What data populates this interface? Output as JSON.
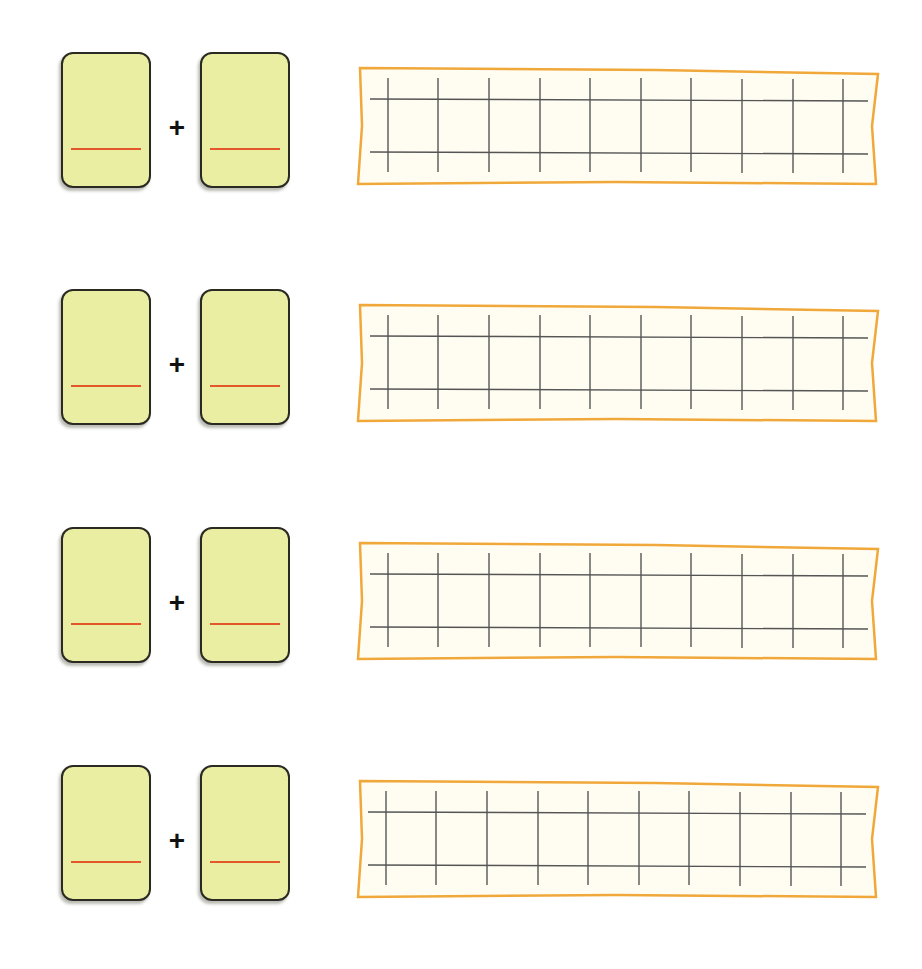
{
  "worksheet": {
    "operator_symbol": "+",
    "colors": {
      "card_fill": "#e9eea2",
      "card_border": "#2a2a22",
      "answer_line": "#e3572b",
      "grid_border": "#f0a83a",
      "grid_fill": "#fffdf2",
      "grid_lines": "#555555"
    },
    "grid": {
      "vertical_lines": 10,
      "horizontal_lines": 2
    },
    "rows": [
      {
        "index": 1,
        "operator": "+",
        "top": 52
      },
      {
        "index": 2,
        "operator": "+",
        "top": 289
      },
      {
        "index": 3,
        "operator": "+",
        "top": 527
      },
      {
        "index": 4,
        "operator": "+",
        "top": 765
      }
    ]
  }
}
